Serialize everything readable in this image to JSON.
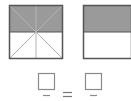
{
  "figure": {
    "left_model": {
      "shape": "square",
      "total_parts": 8,
      "shaded_parts": 4,
      "division": "vertical, horizontal and two diagonal lines through center"
    },
    "right_model": {
      "shape": "rectangle",
      "total_parts": 2,
      "shaded_parts": 1,
      "division": "one horizontal line"
    },
    "equation": {
      "left_numerator_box": "",
      "left_denominator": "",
      "operator": "=",
      "right_numerator_box": "",
      "right_denominator": ""
    },
    "colors": {
      "shaded": "#9a9a9a",
      "outline": "#555555",
      "lines": "#ffffff",
      "box_outline": "#8a8a8a"
    }
  }
}
